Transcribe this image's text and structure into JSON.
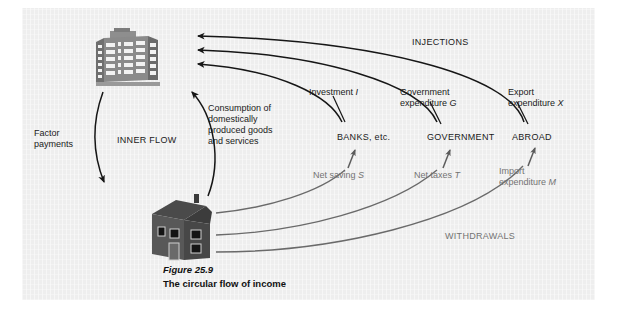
{
  "figure": {
    "number": "Figure 25.9",
    "title": "The circular flow of income",
    "background_color": "#eeeeee",
    "ink_color": "#1a1a1a",
    "secondary_ink_color": "#737373"
  },
  "actors": [
    {
      "id": "firms",
      "icon": "office-building-icon",
      "role": "Firms"
    },
    {
      "id": "households",
      "icon": "house-icon",
      "role": "Households"
    }
  ],
  "inner_flow": {
    "group_label": "INNER FLOW",
    "factor_payments_label": "Factor\npayments",
    "consumption_label": "Consumption of\ndomestically\nproduced goods\nand services"
  },
  "injections": {
    "group_label": "INJECTIONS",
    "items": [
      {
        "flow_label": "Investment ",
        "variable": "I",
        "sector": "BANKS, etc."
      },
      {
        "flow_label": "Government\nexpenditure ",
        "variable": "G",
        "sector": "GOVERNMENT"
      },
      {
        "flow_label": "Export\nexpenditure ",
        "variable": "X",
        "sector": "ABROAD"
      }
    ]
  },
  "withdrawals": {
    "group_label": "WITHDRAWALS",
    "items": [
      {
        "flow_label": "Net saving ",
        "variable": "S",
        "sector": "BANKS, etc."
      },
      {
        "flow_label": "Net taxes ",
        "variable": "T",
        "sector": "GOVERNMENT"
      },
      {
        "flow_label": "Import\nexpenditure ",
        "variable": "M",
        "sector": "ABROAD"
      }
    ]
  }
}
